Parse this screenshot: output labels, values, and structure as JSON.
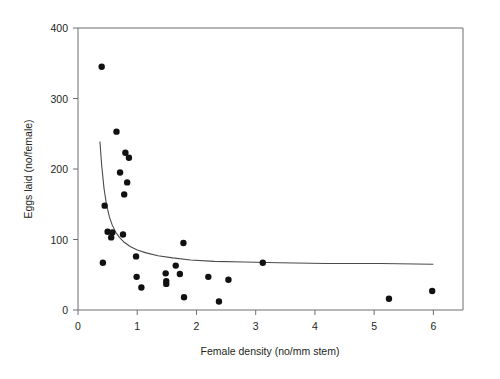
{
  "chart_data": {
    "type": "scatter",
    "title": "",
    "subtitle": "",
    "xlabel": "Female density (no/mm stem)",
    "ylabel": "Eggs laid (no/female)",
    "xlim": [
      0,
      6.5
    ],
    "ylim": [
      0,
      400
    ],
    "xticks": [
      0,
      1,
      2,
      3,
      4,
      5,
      6
    ],
    "xtick_labels": [
      "0",
      "1",
      "2",
      "3",
      "4",
      "5",
      "6"
    ],
    "yticks": [
      0,
      100,
      200,
      300,
      400
    ],
    "ytick_labels": [
      "0",
      "100",
      "200",
      "300",
      "400"
    ],
    "grid": false,
    "legend": null,
    "legend_position": "none",
    "marker": "filled-circle",
    "marker_color": "#111111",
    "curve_color": "#4a4a4a",
    "frame_color": "#6d6e71",
    "background_color": "#ffffff",
    "annotations": [],
    "series": [
      {
        "name": "Observed data",
        "type": "scatter",
        "points": [
          {
            "x": 0.4,
            "y": 345
          },
          {
            "x": 0.65,
            "y": 253
          },
          {
            "x": 0.8,
            "y": 223
          },
          {
            "x": 0.86,
            "y": 216
          },
          {
            "x": 0.71,
            "y": 195
          },
          {
            "x": 0.83,
            "y": 181
          },
          {
            "x": 0.78,
            "y": 164
          },
          {
            "x": 0.45,
            "y": 148
          },
          {
            "x": 0.5,
            "y": 111
          },
          {
            "x": 0.58,
            "y": 110
          },
          {
            "x": 0.56,
            "y": 103
          },
          {
            "x": 0.76,
            "y": 107
          },
          {
            "x": 1.78,
            "y": 95
          },
          {
            "x": 0.98,
            "y": 76
          },
          {
            "x": 3.12,
            "y": 67
          },
          {
            "x": 0.42,
            "y": 67
          },
          {
            "x": 1.65,
            "y": 63
          },
          {
            "x": 1.72,
            "y": 51
          },
          {
            "x": 1.48,
            "y": 52
          },
          {
            "x": 2.2,
            "y": 47
          },
          {
            "x": 0.99,
            "y": 47
          },
          {
            "x": 2.54,
            "y": 43
          },
          {
            "x": 1.49,
            "y": 41
          },
          {
            "x": 1.49,
            "y": 37
          },
          {
            "x": 1.07,
            "y": 32
          },
          {
            "x": 5.98,
            "y": 27
          },
          {
            "x": 1.79,
            "y": 18
          },
          {
            "x": 5.25,
            "y": 16
          },
          {
            "x": 2.38,
            "y": 12
          }
        ]
      },
      {
        "name": "Fitted curve",
        "type": "line",
        "points": [
          {
            "x": 0.37,
            "y": 239
          },
          {
            "x": 0.4,
            "y": 205
          },
          {
            "x": 0.44,
            "y": 172
          },
          {
            "x": 0.48,
            "y": 150
          },
          {
            "x": 0.53,
            "y": 132
          },
          {
            "x": 0.58,
            "y": 120
          },
          {
            "x": 0.64,
            "y": 110
          },
          {
            "x": 0.7,
            "y": 103
          },
          {
            "x": 0.78,
            "y": 96
          },
          {
            "x": 0.88,
            "y": 90
          },
          {
            "x": 1.0,
            "y": 85
          },
          {
            "x": 1.15,
            "y": 81
          },
          {
            "x": 1.35,
            "y": 77
          },
          {
            "x": 1.6,
            "y": 74
          },
          {
            "x": 1.9,
            "y": 71
          },
          {
            "x": 2.3,
            "y": 69
          },
          {
            "x": 2.8,
            "y": 68
          },
          {
            "x": 3.4,
            "y": 67
          },
          {
            "x": 4.2,
            "y": 66
          },
          {
            "x": 5.1,
            "y": 66
          },
          {
            "x": 6.0,
            "y": 65
          }
        ]
      }
    ]
  }
}
